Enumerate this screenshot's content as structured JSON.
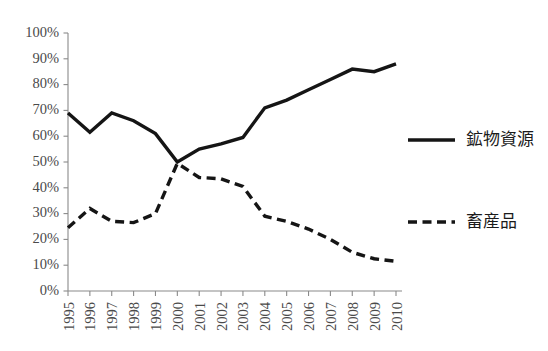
{
  "chart_data": {
    "type": "line",
    "title": "",
    "subtitle": "",
    "xlabel": "",
    "ylabel": "",
    "categories": [
      "1995",
      "1996",
      "1997",
      "1998",
      "1999",
      "2000",
      "2001",
      "2002",
      "2003",
      "2004",
      "2005",
      "2006",
      "2007",
      "2008",
      "2009",
      "2010"
    ],
    "ylim": [
      0,
      100
    ],
    "ytick_labels": [
      "0%",
      "10%",
      "20%",
      "30%",
      "40%",
      "50%",
      "60%",
      "70%",
      "80%",
      "90%",
      "100%"
    ],
    "ytick_values": [
      0,
      10,
      20,
      30,
      40,
      50,
      60,
      70,
      80,
      90,
      100
    ],
    "grid": false,
    "legend_position": "right",
    "series": [
      {
        "name": "鉱物資源",
        "style": "solid",
        "color": "#151515",
        "values": [
          69,
          61.5,
          69,
          66,
          61,
          50,
          55,
          57,
          59.5,
          71,
          74,
          78,
          82,
          86,
          85,
          88
        ]
      },
      {
        "name": "畜産品",
        "style": "dashed",
        "color": "#151515",
        "values": [
          24.5,
          32,
          27,
          26.5,
          30,
          49.5,
          44,
          43.5,
          40.5,
          29,
          27,
          24,
          20,
          15,
          12.5,
          11.5
        ]
      }
    ]
  },
  "legend": {
    "entries": [
      {
        "label": "鉱物資源",
        "style": "solid"
      },
      {
        "label": "畜産品",
        "style": "dashed"
      }
    ]
  }
}
